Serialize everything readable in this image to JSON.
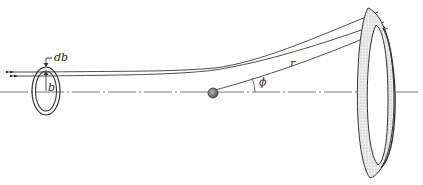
{
  "diagram": {
    "type": "scattering-geometry",
    "labels": {
      "db": "db",
      "b": "b",
      "r": "r",
      "phi": "ϕ"
    },
    "elements": [
      {
        "id": "incident-beam",
        "description": "two parallel incoming rays with arrowheads"
      },
      {
        "id": "annular-ring",
        "description": "incident ring of radius b and width db"
      },
      {
        "id": "scattering-center",
        "description": "shaded sphere on the axis"
      },
      {
        "id": "symmetry-axis",
        "description": "dash-dot horizontal axis"
      },
      {
        "id": "scattered-rays",
        "description": "curved trajectories deflected outward"
      },
      {
        "id": "detector-ring",
        "description": "shaded annular solid-angle ring at distance r"
      },
      {
        "id": "scattering-angle",
        "description": "angle phi between axis and line to ring"
      }
    ],
    "colors": {
      "line": "#3a3a3a",
      "shade": "#d8d8d8",
      "sphere": "#8a8a8a"
    }
  }
}
